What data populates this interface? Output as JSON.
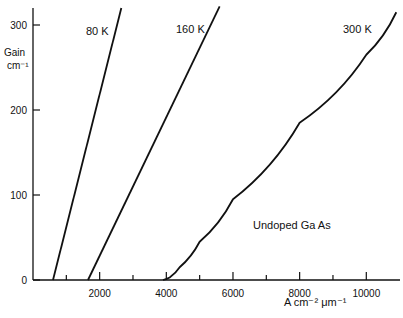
{
  "chart_data": {
    "type": "line",
    "title": "",
    "xlabel": "A cm⁻² μm⁻¹",
    "ylabel": "Gain cm⁻¹",
    "ylabel_line1": "Gain",
    "ylabel_line2": "cm⁻¹",
    "xlim": [
      0,
      11000
    ],
    "ylim": [
      0,
      325
    ],
    "x_ticks": [
      2000,
      4000,
      6000,
      8000,
      10000
    ],
    "x_tick_labels": [
      "2000",
      "4000",
      "6000",
      "8000",
      "10000"
    ],
    "y_ticks": [
      0,
      100,
      200,
      300
    ],
    "y_tick_labels": [
      "0",
      "100",
      "200",
      "300"
    ],
    "grid": false,
    "annotation": "Undoped Ga As",
    "series": [
      {
        "name": "80 K",
        "x": [
          600,
          2650
        ],
        "y": [
          0,
          320
        ]
      },
      {
        "name": "160 K",
        "x": [
          1650,
          5600
        ],
        "y": [
          0,
          322
        ]
      },
      {
        "name": "300 K",
        "x": [
          3900,
          4100,
          4400,
          5000,
          6000,
          8000,
          10000,
          10900
        ],
        "y": [
          0,
          3,
          15,
          45,
          95,
          185,
          265,
          315
        ]
      }
    ]
  }
}
